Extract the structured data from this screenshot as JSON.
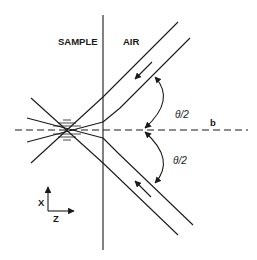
{
  "diagram": {
    "type": "beam-crossing-geometry",
    "regions": {
      "left_label": "SAMPLE",
      "right_label": "AIR"
    },
    "angles": {
      "upper": "θ/2",
      "lower": "θ/2"
    },
    "axis_line_label": "b",
    "coordinate_axes": {
      "vertical": "X",
      "horizontal": "Z"
    },
    "colors": {
      "ink": "#1a1a1a",
      "background": "#ffffff"
    }
  }
}
